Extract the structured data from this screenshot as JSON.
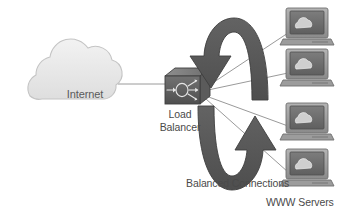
{
  "diagram": {
    "background": "#ffffff",
    "palette": {
      "cloud_fill": "#e9e9e9",
      "cloud_stroke": "#c4c4c4",
      "arrow_fill": "#585858",
      "arrow_stroke": "#3e3e3e",
      "device_body": "#a6a6a6",
      "device_dark": "#5e5e5e",
      "device_screen": "#6e6e6e",
      "line_stroke": "#9a9a9a",
      "text": "#4a4a4a"
    },
    "labels": {
      "internet": "Internet",
      "load_balancer": "Load\nBalancer",
      "load_balancer_line1": "Load",
      "load_balancer_line2": "Balancer",
      "balanced_connections": "Balanced Connections",
      "www_servers": "WWW Servers"
    },
    "nodes": [
      {
        "id": "internet",
        "type": "cloud-icon",
        "label": "Internet",
        "x": 85,
        "y": 90
      },
      {
        "id": "load-balancer",
        "type": "load-balancer-icon",
        "label": "Load Balancer",
        "x": 184,
        "y": 90
      },
      {
        "id": "server-1",
        "type": "www-server-icon",
        "label": "WWW Server",
        "x": 306,
        "y": 27
      },
      {
        "id": "server-2",
        "type": "www-server-icon",
        "label": "WWW Server",
        "x": 306,
        "y": 68
      },
      {
        "id": "server-3",
        "type": "www-server-icon",
        "label": "WWW Server",
        "x": 306,
        "y": 122
      },
      {
        "id": "server-4",
        "type": "www-server-icon",
        "label": "WWW Server",
        "x": 306,
        "y": 168
      }
    ],
    "links": [
      {
        "from": "internet",
        "to": "load-balancer",
        "style": "solid"
      },
      {
        "from": "load-balancer",
        "to": "server-1",
        "style": "solid"
      },
      {
        "from": "load-balancer",
        "to": "server-2",
        "style": "solid"
      },
      {
        "from": "load-balancer",
        "to": "server-3",
        "style": "solid"
      },
      {
        "from": "load-balancer",
        "to": "server-4",
        "style": "solid"
      }
    ],
    "cycle_arrows": [
      {
        "id": "arrow-top",
        "direction": "down-left",
        "description": "thick arc over the top pointing down toward load balancer"
      },
      {
        "id": "arrow-bottom",
        "direction": "up-right",
        "description": "thick U arc pointing up toward servers"
      }
    ],
    "server_count": 4
  }
}
